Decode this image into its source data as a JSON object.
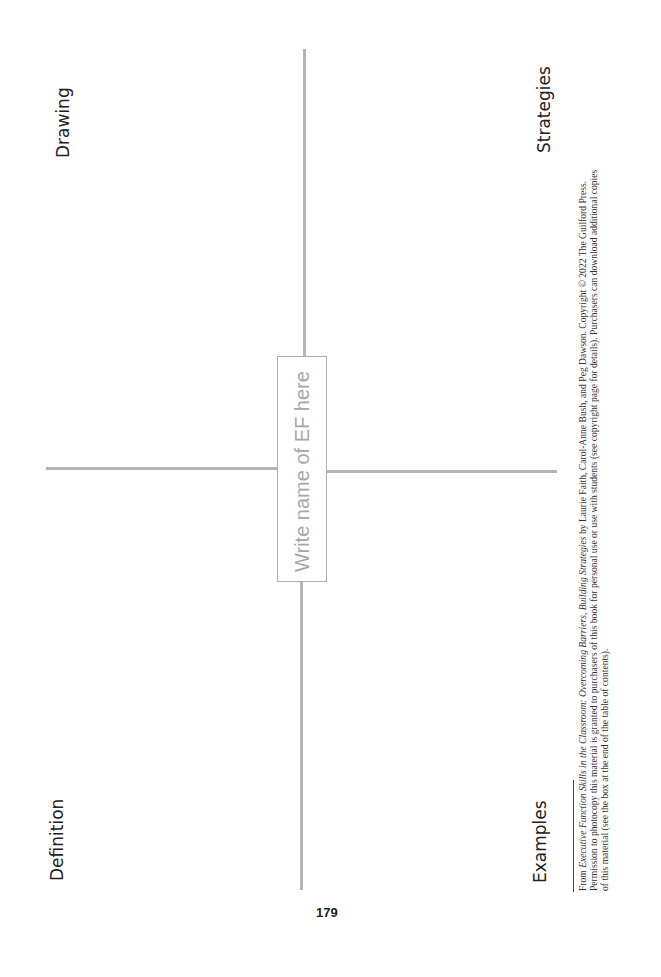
{
  "page": {
    "page_number": "179"
  },
  "organizer": {
    "center_box": "Write name of EF here",
    "quadrants": {
      "top_left": "Drawing",
      "top_right": "Strategies",
      "bottom_left": "Definition",
      "bottom_right": "Examples"
    }
  },
  "footer": {
    "line1_prefix": "From ",
    "line1_title": "Executive Function Skills in the Classroom: Overcoming Barriers, Building Strategies",
    "line1_suffix": " by Laurie Faith, Carol-Anne Bush, and Peg Dawson. Copyright © 2022 The Guilford Press.",
    "line2": "Permission to photocopy this material is granted to purchasers of this book for personal use or use with students (see copyright page for details). Purchasers can download additional copies",
    "line3": "of this material (see the box at the end of the table of contents)."
  }
}
